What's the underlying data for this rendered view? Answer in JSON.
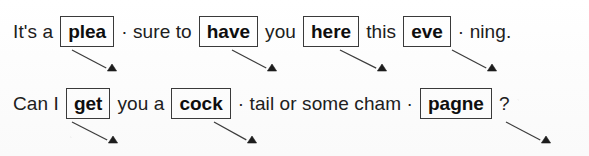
{
  "page": {
    "kind": "worksheet-line-exercise",
    "ink_color": "#202020",
    "box_border_color": "#3a3a3a",
    "arrow_color": "#3c3c3c",
    "background_color": "#fdfdfd"
  },
  "lines": [
    {
      "id": "line-1",
      "tokens": [
        {
          "type": "text",
          "text": "It's a"
        },
        {
          "type": "boxed",
          "text": "plea"
        },
        {
          "type": "text",
          "text": "· sure  to"
        },
        {
          "type": "boxed",
          "text": "have"
        },
        {
          "type": "text",
          "text": "you"
        },
        {
          "type": "boxed",
          "text": "here"
        },
        {
          "type": "text",
          "text": "this"
        },
        {
          "type": "boxed",
          "text": "eve"
        },
        {
          "type": "text",
          "text": "· ning."
        }
      ]
    },
    {
      "id": "line-2",
      "tokens": [
        {
          "type": "text",
          "text": "Can I"
        },
        {
          "type": "boxed",
          "text": "get"
        },
        {
          "type": "text",
          "text": "you a"
        },
        {
          "type": "boxed",
          "text": "cock"
        },
        {
          "type": "text",
          "text": "· tail  or  some cham  ·"
        },
        {
          "type": "boxed",
          "text": "pagne"
        },
        {
          "type": "text",
          "text": "?"
        }
      ]
    }
  ],
  "arrows": [
    {
      "name": "arrow-plea",
      "from_box": "plea",
      "x1": 72,
      "y1": 50,
      "x2": 112,
      "y2": 71
    },
    {
      "name": "arrow-have",
      "from_box": "have",
      "x1": 232,
      "y1": 50,
      "x2": 272,
      "y2": 71
    },
    {
      "name": "arrow-here",
      "from_box": "here",
      "x1": 340,
      "y1": 50,
      "x2": 382,
      "y2": 71
    },
    {
      "name": "arrow-eve",
      "from_box": "eve",
      "x1": 452,
      "y1": 50,
      "x2": 492,
      "y2": 71
    },
    {
      "name": "arrow-get",
      "from_box": "get",
      "x1": 72,
      "y1": 122,
      "x2": 113,
      "y2": 143
    },
    {
      "name": "arrow-cock",
      "from_box": "cock",
      "x1": 214,
      "y1": 122,
      "x2": 252,
      "y2": 143
    },
    {
      "name": "arrow-pagne",
      "from_box": "pagne",
      "x1": 506,
      "y1": 122,
      "x2": 546,
      "y2": 143
    }
  ]
}
